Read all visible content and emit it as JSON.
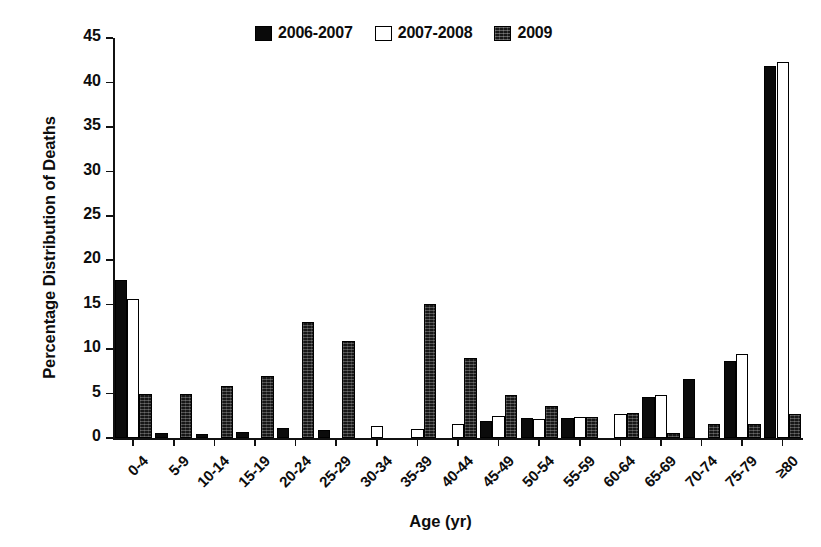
{
  "chart_data": {
    "type": "bar",
    "title": "",
    "xlabel": "Age (yr)",
    "ylabel": "Percentage Distribution of Deaths",
    "ylim": [
      0,
      45
    ],
    "ytick_step": 5,
    "yticks": [
      0,
      5,
      10,
      15,
      20,
      25,
      30,
      35,
      40,
      45
    ],
    "grid": false,
    "legend_position": "top-center",
    "categories": [
      "0-4",
      "5-9",
      "10-14",
      "15-19",
      "20-24",
      "25-29",
      "30-34",
      "35-39",
      "40-44",
      "45-49",
      "50-54",
      "55-59",
      "60-64",
      "65-69",
      "70-74",
      "75-79",
      "≥80"
    ],
    "series": [
      {
        "name": "2006-2007",
        "style": "solid-black",
        "color": "#0b0b0b",
        "values": [
          17.8,
          0.6,
          0.5,
          0.7,
          1.1,
          0.9,
          0.0,
          0.0,
          0.0,
          1.9,
          2.2,
          2.3,
          0.0,
          4.6,
          6.6,
          8.7,
          41.8
        ]
      },
      {
        "name": "2007-2008",
        "style": "hollow-white",
        "color": "#ffffff",
        "values": [
          15.6,
          0.0,
          0.0,
          0.0,
          0.0,
          0.0,
          1.3,
          1.0,
          1.6,
          2.5,
          2.1,
          2.4,
          2.7,
          4.8,
          0.0,
          9.5,
          42.3
        ]
      },
      {
        "name": "2009",
        "style": "dark-textured",
        "color": "#171717",
        "values": [
          5.0,
          4.9,
          5.9,
          7.0,
          13.0,
          10.9,
          0.0,
          15.1,
          9.0,
          4.8,
          3.6,
          2.4,
          2.8,
          0.6,
          1.6,
          1.6,
          2.7
        ]
      }
    ]
  },
  "legend": {
    "items": [
      {
        "label": "2006-2007",
        "swatch": "swatch-solid-icon"
      },
      {
        "label": "2007-2008",
        "swatch": "swatch-hollow-icon"
      },
      {
        "label": "2009",
        "swatch": "swatch-dark-icon"
      }
    ]
  }
}
